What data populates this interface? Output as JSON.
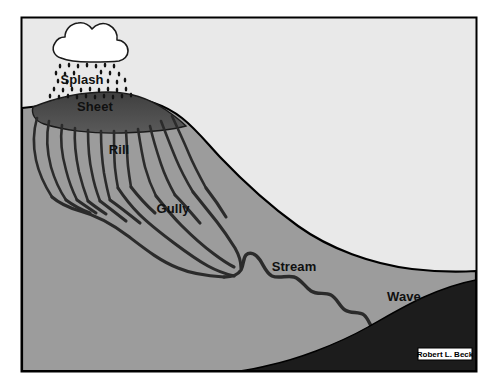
{
  "figure": {
    "frame": {
      "border_color": "#000000",
      "x": 21,
      "y": 17,
      "width": 456,
      "height": 355
    },
    "palette": {
      "page_background": "#ffffff",
      "sky": "#e9e9e9",
      "hillside": "#9c9c9c",
      "sheet_zone": "#4a4a4a",
      "water": "#1c1c1c",
      "channel_line": "#2b2b2b",
      "outline": "#000000",
      "cloud_fill": "#ffffff",
      "label_color": "#101010"
    },
    "labels": [
      {
        "id": "splash",
        "text": "Splash",
        "x": 82,
        "y": 84
      },
      {
        "id": "sheet",
        "text": "Sheet",
        "x": 95,
        "y": 111
      },
      {
        "id": "rill",
        "text": "Rill",
        "x": 119,
        "y": 154
      },
      {
        "id": "gully",
        "text": "Gully",
        "x": 173,
        "y": 213
      },
      {
        "id": "stream",
        "text": "Stream",
        "x": 294,
        "y": 271
      },
      {
        "id": "wave",
        "text": "Wave",
        "x": 404,
        "y": 301
      }
    ],
    "credit": {
      "text": "Robert L. Beck",
      "x": 421,
      "y": 356,
      "box_fill": "#ffffff",
      "box_border": "#000000"
    },
    "elements": {
      "cloud_name": "rain-cloud",
      "rain_name": "rainfall-drops",
      "sheet_name": "sheet-erosion-zone",
      "rills_name": "rill-channels",
      "gully_name": "gully-channels",
      "stream_name": "stream-channel",
      "water_name": "water-body",
      "hill_name": "hillside-landmass",
      "sky_name": "sky-background"
    }
  }
}
